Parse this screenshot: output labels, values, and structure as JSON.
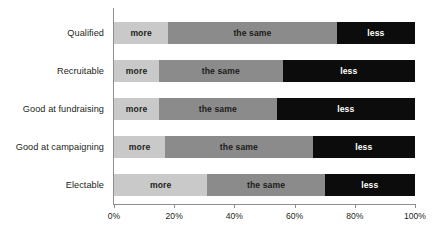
{
  "chart_data": {
    "type": "bar",
    "orientation": "horizontal",
    "stacked": true,
    "stack_mode": "percent",
    "title": "",
    "subtitle": "",
    "xlabel": "",
    "ylabel": "",
    "xlim": [
      0,
      100
    ],
    "grid": false,
    "legend": "none (in-bar labels)",
    "categories": [
      "Qualified",
      "Recruitable",
      "Good at fundraising",
      "Good at campaigning",
      "Electable"
    ],
    "series": [
      {
        "name": "more",
        "color": "#c9c9c9",
        "values": [
          18,
          15,
          15,
          17,
          31
        ]
      },
      {
        "name": "the same",
        "color": "#8b8b8b",
        "values": [
          56,
          41,
          39,
          49,
          39
        ]
      },
      {
        "name": "less",
        "color": "#0c0c0c",
        "values": [
          26,
          44,
          46,
          34,
          30
        ]
      }
    ],
    "xticks": [
      0,
      20,
      40,
      60,
      80,
      100
    ],
    "xtick_labels": [
      "0%",
      "20%",
      "40%",
      "60%",
      "80%",
      "100%"
    ],
    "rows": [
      {
        "category": "Qualified",
        "segments": [
          {
            "label": "more",
            "value": 18,
            "class": "seg-more"
          },
          {
            "label": "the same",
            "value": 56,
            "class": "seg-same"
          },
          {
            "label": "less",
            "value": 26,
            "class": "seg-less"
          }
        ]
      },
      {
        "category": "Recruitable",
        "segments": [
          {
            "label": "more",
            "value": 15,
            "class": "seg-more"
          },
          {
            "label": "the same",
            "value": 41,
            "class": "seg-same"
          },
          {
            "label": "less",
            "value": 44,
            "class": "seg-less"
          }
        ]
      },
      {
        "category": "Good at fundraising",
        "segments": [
          {
            "label": "more",
            "value": 15,
            "class": "seg-more"
          },
          {
            "label": "the same",
            "value": 39,
            "class": "seg-same"
          },
          {
            "label": "less",
            "value": 46,
            "class": "seg-less"
          }
        ]
      },
      {
        "category": "Good at campaigning",
        "segments": [
          {
            "label": "more",
            "value": 17,
            "class": "seg-more"
          },
          {
            "label": "the same",
            "value": 49,
            "class": "seg-same"
          },
          {
            "label": "less",
            "value": 34,
            "class": "seg-less"
          }
        ]
      },
      {
        "category": "Electable",
        "segments": [
          {
            "label": "more",
            "value": 31,
            "class": "seg-more"
          },
          {
            "label": "the same",
            "value": 39,
            "class": "seg-same"
          },
          {
            "label": "less",
            "value": 30,
            "class": "seg-less"
          }
        ]
      }
    ]
  },
  "colors": {
    "more": "#c9c9c9",
    "the_same": "#8b8b8b",
    "less": "#0c0c0c",
    "axis": "#8e8e8e",
    "text": "#231f20",
    "background": "#ffffff"
  },
  "layout": {
    "row_tops": [
      14,
      52,
      90,
      128,
      166
    ],
    "bar_height": 22
  }
}
